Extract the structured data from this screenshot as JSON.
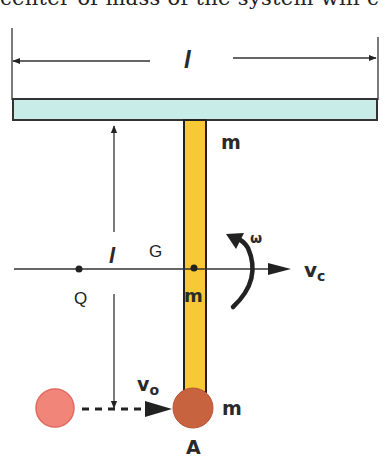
{
  "caption": {
    "text": "center of mass of the system will c"
  },
  "diagram": {
    "top_dimension_label": "l",
    "vertical_dimension_label": "l",
    "bar_mass_label": "m",
    "rod_mass_label": "m",
    "ball_mass_label": "m",
    "center_label": "G",
    "point_q_label": "Q",
    "point_a_label": "A",
    "velocity_c_label": "v",
    "velocity_c_sub": "c",
    "velocity_o_label": "v",
    "velocity_o_sub": "o",
    "omega_label": "ω",
    "colors": {
      "bar_fill": "#c8ece8",
      "rod_fill": "#f7c935",
      "ball_a_fill": "#c7643f",
      "incoming_ball_fill": "#f2857a",
      "line": "#222222"
    }
  }
}
